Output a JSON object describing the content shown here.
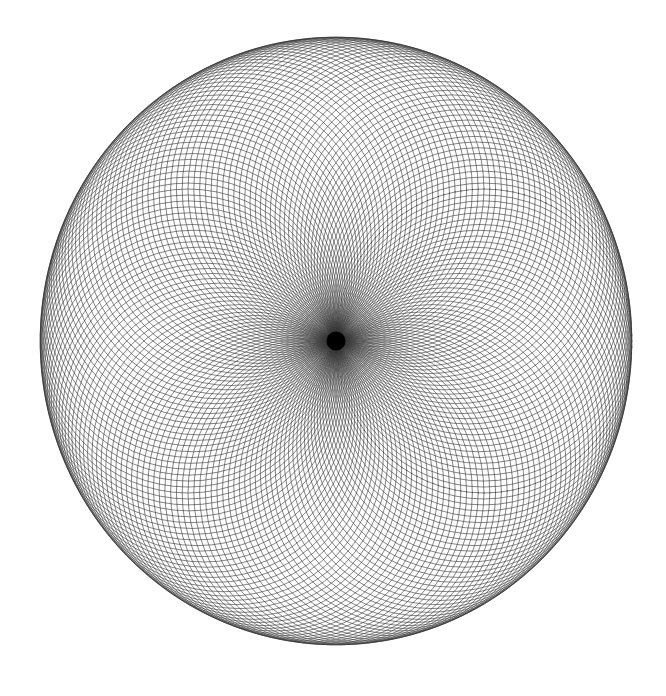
{
  "page": {
    "background_color": "#ffffff",
    "width": 666,
    "height": 696
  },
  "chart_data": {
    "type": "scatter",
    "title": "",
    "subtitle": "",
    "xlabel": "",
    "ylabel": "",
    "grid": false,
    "legend": false,
    "legend_position": "none",
    "render_style": {
      "stroke_color": "#333333",
      "stroke_width": 0.6,
      "fill": "none",
      "background": "#ffffff",
      "line_cap": "round",
      "antialias": true
    },
    "focal_point": {
      "x": 336,
      "y": 341
    },
    "envelope": {
      "shape": "circle",
      "center_x": 336,
      "center_y": 341,
      "radius_x": 296,
      "radius_y": 304,
      "left": 40,
      "right": 632,
      "top": 37,
      "bottom": 645
    },
    "generator": {
      "circle_count": 160,
      "circle_radius": 150,
      "center_locus_radius": 150,
      "start_angle_deg": 0,
      "angle_step_deg": 2.25,
      "eccentricity_x": 0.9866,
      "eccentricity_y": 1.0133
    },
    "axis_ranges": {
      "xlim": [
        0,
        666
      ],
      "ylim": [
        0,
        696
      ]
    },
    "series": [
      {
        "name": "circle-pencil",
        "kind": "circles",
        "count": 160,
        "radius": 150,
        "note": "circle i has center at (336 + 150*cos(theta_i)*0.9866, 341 + 150*sin(theta_i)*1.0133), theta_i = i * 2.25 degrees"
      }
    ],
    "annotations": [
      {
        "name": "dark-core",
        "x": 336,
        "y": 341,
        "radius": 10,
        "color": "#000000",
        "note": "all circles converge at the focal point producing a solid black disk"
      },
      {
        "name": "radial-spoke-halo",
        "x": 336,
        "y": 341,
        "radius": 40,
        "note": "dense near-radial bundle fading outward from the core"
      }
    ]
  }
}
